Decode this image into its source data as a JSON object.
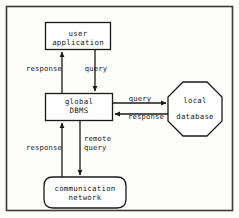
{
  "diagram": {
    "style": {
      "stroke_color": "#1a1a1a",
      "fill_color": "#ffffff",
      "background": "#fdfdfc",
      "border_color": "#3a3a3a"
    },
    "nodes": [
      {
        "id": "user-application",
        "shape": "rectangle",
        "label": "user\napplication"
      },
      {
        "id": "global-dbms",
        "shape": "rectangle",
        "label": "global\nDBMS"
      },
      {
        "id": "local-database",
        "shape": "octagon",
        "label": "local\ndatabase"
      },
      {
        "id": "communication-network",
        "shape": "rounded-rectangle",
        "label": "communication\nnetwork"
      }
    ],
    "edges": [
      {
        "id": "response-user",
        "from": "global-dbms",
        "to": "user-application",
        "label": "response",
        "direction": "up"
      },
      {
        "id": "query-user",
        "from": "user-application",
        "to": "global-dbms",
        "label": "query",
        "direction": "down"
      },
      {
        "id": "query-local",
        "from": "global-dbms",
        "to": "local-database",
        "label": "query",
        "direction": "right"
      },
      {
        "id": "response-local",
        "from": "local-database",
        "to": "global-dbms",
        "label": "response",
        "direction": "left"
      },
      {
        "id": "response-network",
        "from": "communication-network",
        "to": "global-dbms",
        "label": "response",
        "direction": "up"
      },
      {
        "id": "remote-query",
        "from": "global-dbms",
        "to": "communication-network",
        "label": "remote\nquery",
        "direction": "down"
      }
    ]
  },
  "labels": {
    "user_application": "user\napplication",
    "global_dbms": "global\nDBMS",
    "local_database_line1": "local",
    "local_database_line2": "database",
    "communication_network": "communication\nnetwork",
    "response_upper": "response",
    "query_upper": "query",
    "query_right": "query",
    "response_right": "response",
    "response_lower": "response",
    "remote_query": "remote\nquery"
  }
}
